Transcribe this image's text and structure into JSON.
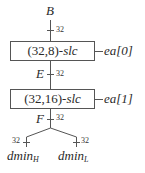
{
  "diagram": {
    "input": {
      "label": "B",
      "width": "32"
    },
    "blocks": [
      {
        "label_prefix": "(32,8)-",
        "label_italic": "slc",
        "side_label": "ea[0]",
        "output": {
          "label": "E",
          "width": "32"
        }
      },
      {
        "label_prefix": "(32,16)-",
        "label_italic": "slc",
        "side_label": "ea[1]",
        "output": {
          "label": "F",
          "width": "32"
        }
      }
    ],
    "outputs": [
      {
        "base": "dmin",
        "sub": "H",
        "width": "32"
      },
      {
        "base": "dmin",
        "sub": "L",
        "width": "32"
      }
    ],
    "colors": {
      "line": "#555555",
      "text": "#2a2a2a"
    }
  }
}
